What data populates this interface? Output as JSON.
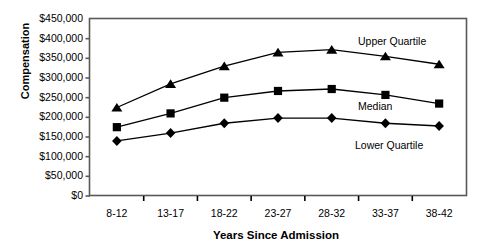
{
  "chart_data": {
    "type": "line",
    "title": "",
    "xlabel": "Years Since Admission",
    "ylabel": "Compensation",
    "categories": [
      "8-12",
      "13-17",
      "18-22",
      "23-27",
      "28-32",
      "33-37",
      "38-42"
    ],
    "ylim": [
      0,
      450000
    ],
    "ytick_labels": [
      "$450,000",
      "$400,000",
      "$350,000",
      "$300,000",
      "$250,000",
      "$200,000",
      "$150,000",
      "$100,000",
      "$50,000",
      "$0"
    ],
    "ytick_values": [
      450000,
      400000,
      350000,
      300000,
      250000,
      200000,
      150000,
      100000,
      50000,
      0
    ],
    "grid": false,
    "legend_position": "inline-annotations",
    "series": [
      {
        "name": "Upper Quartile",
        "marker": "triangle",
        "color": "#000000",
        "values": [
          225000,
          285000,
          330000,
          365000,
          372000,
          355000,
          335000
        ]
      },
      {
        "name": "Median",
        "marker": "square",
        "color": "#000000",
        "values": [
          175000,
          210000,
          250000,
          267000,
          272000,
          257000,
          235000
        ]
      },
      {
        "name": "Lower Quartile",
        "marker": "diamond",
        "color": "#000000",
        "values": [
          140000,
          160000,
          185000,
          198000,
          198000,
          185000,
          178000
        ]
      }
    ],
    "annotations": [
      {
        "text": "Upper Quartile",
        "x": 358,
        "y": 36
      },
      {
        "text": "Median",
        "x": 358,
        "y": 101
      },
      {
        "text": "Lower Quartile",
        "x": 355,
        "y": 140
      }
    ]
  }
}
